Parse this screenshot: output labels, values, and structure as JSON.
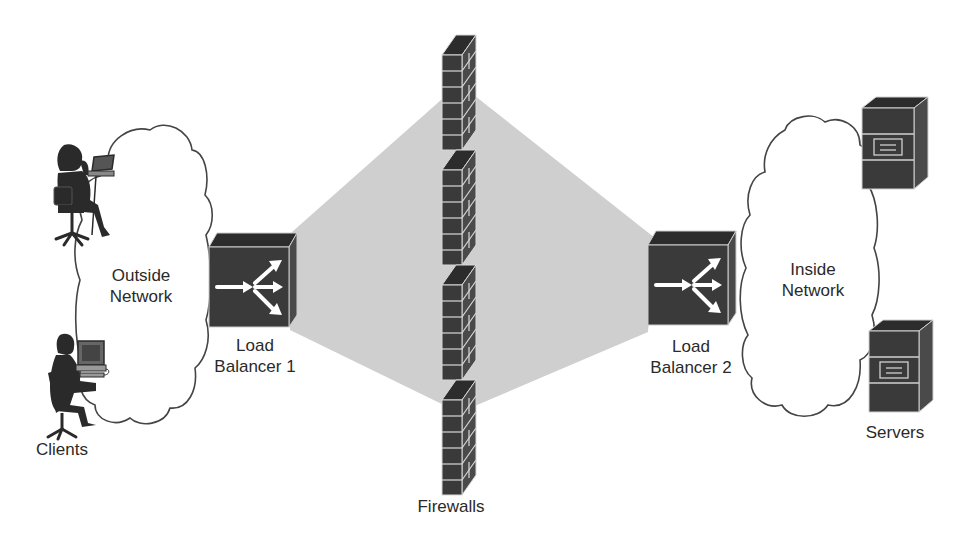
{
  "diagram": {
    "colors": {
      "device_fill": "#3a3a3a",
      "device_top": "#2c2c2c",
      "device_side": "#4a4a4a",
      "shade_region": "#cfcfcf",
      "cloud_stroke": "#444444",
      "brick_line": "#d8d8d8",
      "text": "#2a2a2a"
    },
    "nodes": {
      "outside_network": {
        "line1": "Outside",
        "line2": "Network",
        "type": "cloud"
      },
      "inside_network": {
        "line1": "Inside",
        "line2": "Network",
        "type": "cloud"
      },
      "load_balancer_1": {
        "line1": "Load",
        "line2": "Balancer 1",
        "type": "load-balancer"
      },
      "load_balancer_2": {
        "line1": "Load",
        "line2": "Balancer 2",
        "type": "load-balancer"
      },
      "clients": {
        "label": "Clients",
        "count": 2,
        "type": "workstation-user"
      },
      "firewalls": {
        "label": "Firewalls",
        "count": 4,
        "type": "firewall"
      },
      "servers": {
        "label": "Servers",
        "count": 2,
        "type": "server"
      }
    },
    "edges": [
      {
        "from": "clients",
        "to": "outside_network"
      },
      {
        "from": "outside_network",
        "to": "load_balancer_1"
      },
      {
        "from": "load_balancer_1",
        "to": "firewalls"
      },
      {
        "from": "firewalls",
        "to": "load_balancer_2"
      },
      {
        "from": "load_balancer_2",
        "to": "inside_network"
      },
      {
        "from": "inside_network",
        "to": "servers"
      }
    ]
  }
}
